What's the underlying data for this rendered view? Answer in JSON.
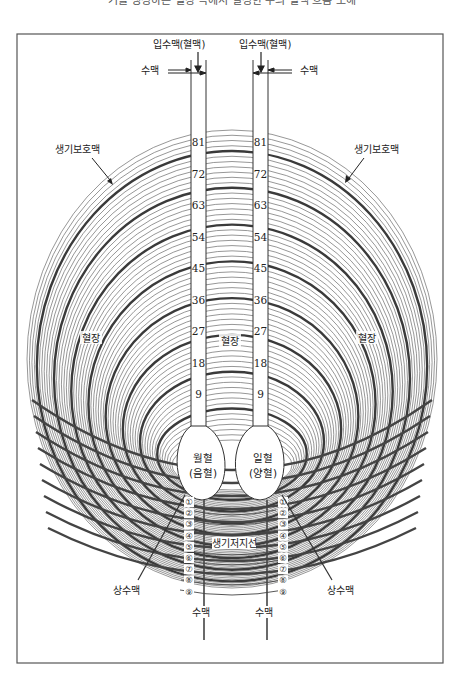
{
  "caption": "기를 생성하는 혈장 속에서 일정한 수의 혈액 흐름 도해",
  "labels": {
    "top_left_inflow": "입수맥(혈맥)",
    "top_right_inflow": "입수맥(혈맥)",
    "left_sumaek": "수맥",
    "right_sumaek": "수맥",
    "left_protect": "생기보호맥",
    "right_protect": "생기보호맥",
    "left_plasma": "혈장",
    "center_plasma": "혈장",
    "right_plasma": "혈장",
    "left_bulb_line1": "월혈",
    "left_bulb_line2": "(음혈)",
    "right_bulb_line1": "일혈",
    "right_bulb_line2": "(양혈)",
    "storage_line": "생기저지선",
    "left_upper_sumaek": "상수맥",
    "right_upper_sumaek": "상수맥",
    "bottom_left_sumaek": "수맥",
    "bottom_right_sumaek": "수맥"
  },
  "tube_scale": [
    "81",
    "72",
    "63",
    "54",
    "45",
    "36",
    "27",
    "18",
    "9"
  ],
  "circled_numbers": [
    "①",
    "②",
    "③",
    "④",
    "⑤",
    "⑥",
    "⑦",
    "⑧",
    "⑨"
  ],
  "colors": {
    "line": "#333333",
    "ring_thin": "#555555",
    "ring_thick": "#444444",
    "frame": "#555555"
  }
}
